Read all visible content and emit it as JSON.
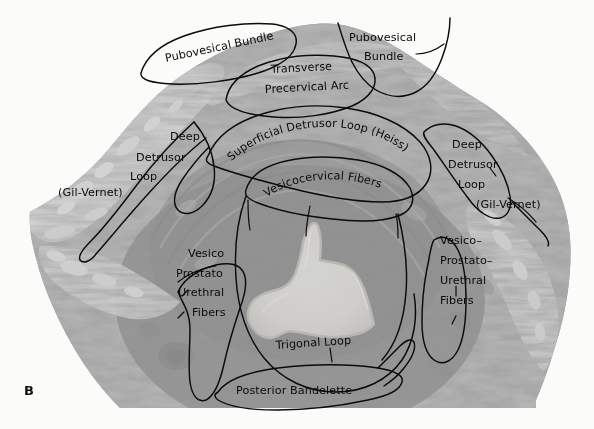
{
  "figure": {
    "panel_letter": "B",
    "background_color": "#fbfbfa",
    "tissue_color": "#9a9a9a",
    "outline_color": "#0b0b0b",
    "label_color": "#0a0a0a",
    "lumen_color": "#ededea"
  },
  "annotations": {
    "pubovesical_bundle_left": "Pubovesical Bundle",
    "pubovesical_bundle_right_line1": "Pubovesical",
    "pubovesical_bundle_right_line2": "Bundle",
    "transverse_precervical_arc_line1": "Transverse",
    "transverse_precervical_arc_line2": "Precervical Arc",
    "superficial_detrusor_loop": "Superficial Detrusor Loop (Heiss)",
    "vesicocervical_fibers": "Vesicocervical Fibers",
    "deep_detrusor_left_line1": "Deep",
    "deep_detrusor_left_line2": "Detrusor",
    "deep_detrusor_left_line3": "Loop",
    "deep_detrusor_left_line4": "(Gil-Vernet)",
    "deep_detrusor_right_line1": "Deep",
    "deep_detrusor_right_line2": "Detrusor",
    "deep_detrusor_right_line3": "Loop",
    "deep_detrusor_right_line4": "(Gil-Vernet)",
    "vpu_left_line1": "Vesico",
    "vpu_left_line2": "Prostato",
    "vpu_left_line3": "Urethral",
    "vpu_left_line4": "Fibers",
    "vpu_right_line1": "Vesico–",
    "vpu_right_line2": "Prostato–",
    "vpu_right_line3": "Urethral",
    "vpu_right_line4": "Fibers",
    "trigonal_loop": "Trigonal  Loop",
    "posterior_bandelette": "Posterior  Bandelette"
  }
}
